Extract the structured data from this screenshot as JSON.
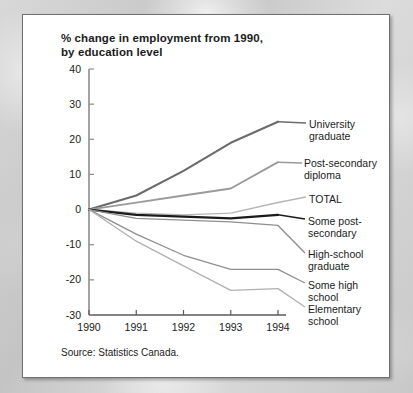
{
  "figure": {
    "title_line1": "% change in employment from 1990,",
    "title_line2": "by education level",
    "source": "Source: Statistics Canada."
  },
  "chart_data": {
    "type": "line",
    "title": "% change in employment from 1990, by education level",
    "subtitle": "",
    "xlabel": "",
    "ylabel": "",
    "x": [
      1990,
      1991,
      1992,
      1993,
      1994
    ],
    "categories": [
      "1990",
      "1991",
      "1992",
      "1993",
      "1994"
    ],
    "xlim": [
      1990,
      1994
    ],
    "ylim": [
      -30,
      40
    ],
    "yticks": [
      -30,
      -20,
      -10,
      0,
      10,
      20,
      30,
      40
    ],
    "ytick_labels": [
      "-30",
      "-20",
      "-10",
      "0",
      "10",
      "20",
      "30",
      "40"
    ],
    "xticks": [
      1990,
      1991,
      1992,
      1993,
      1994
    ],
    "xtick_labels": [
      "1990",
      "1991",
      "1992",
      "1993",
      "1994"
    ],
    "grid": false,
    "legend_position": "right-inline-annotations",
    "series": [
      {
        "name": "University graduate",
        "values": [
          0,
          4,
          11,
          19,
          25
        ],
        "color": "#6b6b6b",
        "width": 2.1
      },
      {
        "name": "Post-secondary diploma",
        "values": [
          0,
          2,
          4,
          6,
          13.5
        ],
        "color": "#9a9a9a",
        "width": 1.8
      },
      {
        "name": "TOTAL",
        "values": [
          0,
          -1,
          -1.5,
          -1,
          2
        ],
        "color": "#b5b5b5",
        "width": 1.4
      },
      {
        "name": "Some post-secondary",
        "values": [
          0,
          -1.5,
          -2,
          -2.5,
          -1.5
        ],
        "color": "#1b1b1b",
        "width": 2.3
      },
      {
        "name": "High-school graduate",
        "values": [
          0,
          -2.5,
          -3,
          -3.5,
          -4.5
        ],
        "color": "#8f8f8f",
        "width": 1.4
      },
      {
        "name": "Some high school",
        "values": [
          0,
          -7,
          -13,
          -17,
          -17
        ],
        "color": "#8f8f8f",
        "width": 1.3
      },
      {
        "name": "Elementary school",
        "values": [
          0,
          -9,
          -16,
          -23,
          -22.5
        ],
        "color": "#b0b0b0",
        "width": 1.3
      }
    ]
  },
  "annotations": [
    {
      "id": "university-graduate",
      "line1": "University",
      "line2": "graduate"
    },
    {
      "id": "post-secondary-diploma",
      "line1": "Post-secondary",
      "line2": "diploma"
    },
    {
      "id": "total",
      "line1": "TOTAL",
      "line2": ""
    },
    {
      "id": "some-post-secondary",
      "line1": "Some post-",
      "line2": "secondary"
    },
    {
      "id": "high-school-graduate",
      "line1": "High-school",
      "line2": "graduate"
    },
    {
      "id": "some-high-school",
      "line1": "Some high school",
      "line2": ""
    },
    {
      "id": "elementary-school",
      "line1": "Elementary",
      "line2": "school"
    }
  ]
}
